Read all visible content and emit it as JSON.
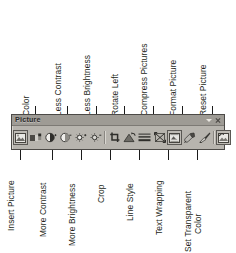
{
  "diagram": {
    "toolbar": {
      "name": "Picture",
      "title_text": "Picture",
      "caret_icon": "chevron-down-icon",
      "close_icon": "close-icon",
      "background_color": "#b7b4ae",
      "titlebar_color": "#9e9b95",
      "border_color": "#4c4a47"
    },
    "buttons": [
      {
        "index": 1,
        "name": "insert-picture",
        "label": "Insert Picture",
        "icon": "insert-picture-icon",
        "label_side": "bottom"
      },
      {
        "index": 2,
        "name": "color",
        "label": "Color",
        "icon": "color-icon",
        "label_side": "top"
      },
      {
        "index": 3,
        "name": "more-contrast",
        "label": "More Contrast",
        "icon": "more-contrast-icon",
        "label_side": "bottom"
      },
      {
        "index": 4,
        "name": "less-contrast",
        "label": "Less Contrast",
        "icon": "less-contrast-icon",
        "label_side": "top"
      },
      {
        "index": 5,
        "name": "more-brightness",
        "label": "More Brightness",
        "icon": "more-brightness-icon",
        "label_side": "bottom"
      },
      {
        "index": 6,
        "name": "less-brightness",
        "label": "Less Brightness",
        "icon": "less-brightness-icon",
        "label_side": "top"
      },
      {
        "index": 7,
        "name": "crop",
        "label": "Crop",
        "icon": "crop-icon",
        "label_side": "bottom"
      },
      {
        "index": 8,
        "name": "rotate-left",
        "label": "Rotate Left",
        "icon": "rotate-left-icon",
        "label_side": "top"
      },
      {
        "index": 9,
        "name": "line-style",
        "label": "Line Style",
        "icon": "line-style-icon",
        "label_side": "bottom"
      },
      {
        "index": 10,
        "name": "compress-pictures",
        "label": "Compress Pictures",
        "icon": "compress-pictures-icon",
        "label_side": "top"
      },
      {
        "index": 11,
        "name": "text-wrapping",
        "label": "Text Wrapping",
        "icon": "text-wrapping-icon",
        "label_side": "bottom"
      },
      {
        "index": 12,
        "name": "format-picture",
        "label": "Format Picture",
        "icon": "format-picture-icon",
        "label_side": "top"
      },
      {
        "index": 13,
        "name": "set-transparent-color",
        "label": "Set Transparent Color",
        "icon": "set-transparent-color-icon",
        "label_side": "bottom"
      },
      {
        "index": 14,
        "name": "reset-picture",
        "label": "Reset Picture",
        "icon": "reset-picture-icon",
        "label_side": "top"
      }
    ],
    "top_labels": [
      "Color",
      "Less Contrast",
      "Less Brightness",
      "Rotate Left",
      "Compress Pictures",
      "Format Picture",
      "Reset Picture"
    ],
    "bottom_labels": [
      "Insert Picture",
      "More Contrast",
      "More Brightness",
      "Crop",
      "Line Style",
      "Text Wrapping",
      "Set Transparent"
    ],
    "bottom_label_extra": "Color",
    "leader_line_color": "#1b1b1b"
  }
}
